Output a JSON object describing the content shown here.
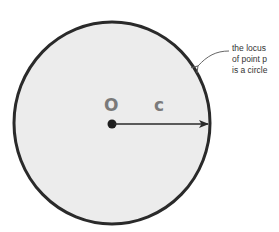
{
  "diagram": {
    "title": "",
    "circle": {
      "fill": "#ececec",
      "stroke": "#2a2a2a",
      "cx": 112,
      "cy": 123,
      "rx": 98,
      "ry": 101
    },
    "center_label": "O",
    "radius_label": "c",
    "annotation": {
      "lines": [
        "the locus",
        "of point p",
        "is a circle"
      ],
      "text_color": "#333333"
    },
    "label_color": "#7a7a7a",
    "arrow_color": "#2a2a2a"
  }
}
